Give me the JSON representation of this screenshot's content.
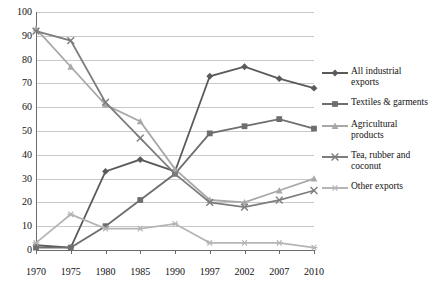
{
  "chart_data": {
    "type": "line",
    "title": "",
    "subtitle": "",
    "xlabel": "",
    "ylabel": "",
    "categories": [
      "1970",
      "1975",
      "1980",
      "1985",
      "1990",
      "1997",
      "2002",
      "2007",
      "2010"
    ],
    "ylim": [
      0,
      100
    ],
    "yticks": [
      0,
      10,
      20,
      30,
      40,
      50,
      60,
      70,
      80,
      90,
      100
    ],
    "grid": true,
    "legend_position": "right",
    "series": [
      {
        "name": "All industrial exports",
        "color": "#5a5a5a",
        "marker": "diamond",
        "values": [
          2,
          1,
          33,
          38,
          33,
          73,
          77,
          72,
          68
        ]
      },
      {
        "name": "Textiles & garments",
        "color": "#6e6e6e",
        "marker": "square",
        "values": [
          1,
          1,
          10,
          21,
          32,
          49,
          52,
          55,
          51
        ]
      },
      {
        "name": "Agricultural products",
        "color": "#a8a8a8",
        "marker": "triangle",
        "values": [
          93,
          77,
          61,
          54,
          34,
          21,
          20,
          25,
          30
        ]
      },
      {
        "name": "Tea, rubber and coconut",
        "color": "#7d7d7d",
        "marker": "cross",
        "values": [
          92,
          88,
          62,
          47,
          32,
          20,
          18,
          21,
          25
        ]
      },
      {
        "name": "Other exports",
        "color": "#b5b5b5",
        "marker": "asterisk",
        "values": [
          3,
          15,
          9,
          9,
          11,
          3,
          3,
          3,
          1
        ]
      }
    ]
  }
}
